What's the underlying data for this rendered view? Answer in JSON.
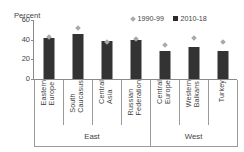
{
  "chart_data": {
    "type": "bar",
    "title": "",
    "ylabel": "Percent",
    "xlabel": "",
    "ylim": [
      0,
      60
    ],
    "yticks": [
      0,
      20,
      40,
      60
    ],
    "grid": false,
    "legend_position": "top-right",
    "categories": [
      "Eastern Europe",
      "South Caucasus",
      "Central Asia",
      "Russian Federation",
      "Central Europe",
      "Western Balkans",
      "Turkey"
    ],
    "groups": [
      {
        "label": "East",
        "categories": [
          "Eastern Europe",
          "South Caucasus",
          "Central Asia",
          "Russian Federation"
        ]
      },
      {
        "label": "West",
        "categories": [
          "Central Europe",
          "Western Balkans",
          "Turkey"
        ]
      }
    ],
    "series": [
      {
        "name": "1990-99",
        "marker": "diamond",
        "color": "#a9a9a9",
        "values": [
          43,
          52,
          38,
          41,
          35,
          42,
          38
        ]
      },
      {
        "name": "2010-18",
        "marker": "square",
        "color": "#333333",
        "values": [
          42,
          46,
          39,
          40,
          28,
          33,
          28
        ]
      }
    ]
  },
  "axis": {
    "title": "Percent",
    "ticks": [
      "60",
      "40",
      "20",
      "0"
    ]
  },
  "legend": {
    "items": [
      {
        "label": "1990-99",
        "swatch": "diamond-marker-icon"
      },
      {
        "label": "2010-18",
        "swatch": "square-marker-icon"
      }
    ]
  },
  "categories": [
    {
      "line1": "Eastern",
      "line2": "Europe"
    },
    {
      "line1": "South",
      "line2": "Caucasus"
    },
    {
      "line1": "Central",
      "line2": "Asia"
    },
    {
      "line1": "Russian",
      "line2": "Federation"
    },
    {
      "line1": "Central",
      "line2": "Europe"
    },
    {
      "line1": "Western",
      "line2": "Balkans"
    },
    {
      "line1": "Turkey",
      "line2": ""
    }
  ],
  "category_labels": [
    "Eastern\nEurope",
    "South\nCaucasus",
    "Central\nAsia",
    "Russian\nFederation",
    "Central\nEurope",
    "Western\nBalkans",
    "Turkey"
  ],
  "groups": [
    {
      "label": "East"
    },
    {
      "label": "West"
    }
  ],
  "colors": {
    "bar": "#333333",
    "marker": "#a9a9a9",
    "axis": "#8a8a8a",
    "text": "#3f3f3f",
    "background": "#ffffff"
  }
}
